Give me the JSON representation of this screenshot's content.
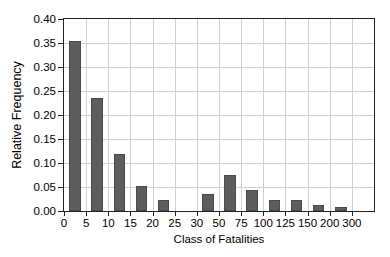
{
  "chart_data": {
    "type": "bar",
    "title": "",
    "xlabel": "Class of Fatalities",
    "ylabel": "Relative Frequency",
    "ylim": [
      0.0,
      0.4
    ],
    "ytick_labels": [
      "0.00",
      "0.05",
      "0.10",
      "0.15",
      "0.20",
      "0.25",
      "0.30",
      "0.35",
      "0.40"
    ],
    "ytick_values": [
      0.0,
      0.05,
      0.1,
      0.15,
      0.2,
      0.25,
      0.3,
      0.35,
      0.4
    ],
    "xtick_labels": [
      "0",
      "5",
      "10",
      "15",
      "20",
      "25",
      "30",
      "50",
      "75",
      "100",
      "125",
      "150",
      "200",
      "300"
    ],
    "grid": true,
    "legend": null,
    "bar_color": "#5d5d5d",
    "axis_color": "#222222",
    "grid_color": "#d0d0d0",
    "categories": [
      "0-5",
      "5-10",
      "10-15",
      "15-20",
      "20-25",
      "25-30",
      "30-50",
      "50-75",
      "75-100",
      "100-125",
      "125-150",
      "150-200",
      "200-300"
    ],
    "values": [
      0.354,
      0.235,
      0.118,
      0.052,
      0.022,
      0.0,
      0.035,
      0.074,
      0.044,
      0.022,
      0.022,
      0.013,
      0.008
    ],
    "bar_centers_index": [
      0.5,
      1.5,
      2.5,
      3.5,
      4.5,
      5.5,
      6.5,
      7.5,
      8.5,
      9.5,
      10.5,
      11.5,
      12.5
    ]
  }
}
